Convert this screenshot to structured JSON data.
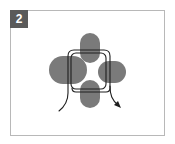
{
  "step": {
    "number": "2",
    "badge_color": "#5a5a5a"
  },
  "diagram": {
    "lobe_color": "#7a7a7a",
    "thread_color": "#1e1e1e",
    "frame_color": "#b8b8b8",
    "lobes": [
      {
        "name": "top",
        "x": 80,
        "y": 33,
        "w": 20,
        "h": 30
      },
      {
        "name": "left",
        "x": 49,
        "y": 56,
        "w": 38,
        "h": 28
      },
      {
        "name": "right",
        "x": 98,
        "y": 61,
        "w": 28,
        "h": 22
      },
      {
        "name": "bottom",
        "x": 80,
        "y": 80,
        "w": 20,
        "h": 28
      }
    ]
  }
}
